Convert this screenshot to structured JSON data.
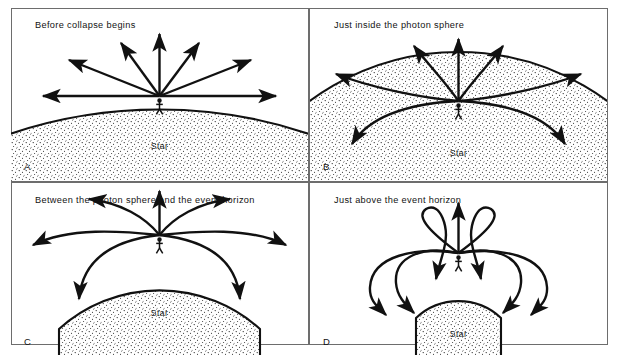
{
  "figure": {
    "background": "#ffffff",
    "ink_color": "#111111",
    "frame_color": "#6d6d6d",
    "star_label": "Star"
  },
  "panels": [
    {
      "letter": "A",
      "caption": "Before collapse begins",
      "star_label": "Star",
      "stage": "before-collapse",
      "star_radius_px": 470,
      "escaping_rays": 7,
      "trapped_rays": 0,
      "ray_shape": "straight",
      "ray_angles_deg": [
        180,
        148,
        117,
        90,
        63,
        32,
        0
      ]
    },
    {
      "letter": "B",
      "caption": "Just inside the photon sphere",
      "star_label": "Star",
      "stage": "inside-photon-sphere",
      "star_radius_px": 250,
      "escaping_rays": 5,
      "trapped_rays": 2,
      "ray_shape": "curved-outward",
      "ray_angles_deg": [
        180,
        148,
        117,
        90,
        63,
        32,
        0
      ]
    },
    {
      "letter": "C",
      "caption": "Between the photon sphere and the event horizon",
      "star_label": "Star",
      "stage": "between-photon-sphere-and-horizon",
      "star_radius_px": 150,
      "escaping_rays": 3,
      "trapped_rays": 4,
      "ray_shape": "strongly-curved",
      "ray_angles_deg": [
        180,
        148,
        117,
        90,
        63,
        32,
        0
      ]
    },
    {
      "letter": "D",
      "caption": "Just above the event horizon",
      "star_label": "Star",
      "stage": "just-above-event-horizon",
      "star_radius_px": 62,
      "escaping_rays": 1,
      "trapped_rays": 6,
      "ray_shape": "looping-back",
      "ray_angles_deg": [
        180,
        148,
        117,
        90,
        63,
        32,
        0
      ]
    }
  ]
}
